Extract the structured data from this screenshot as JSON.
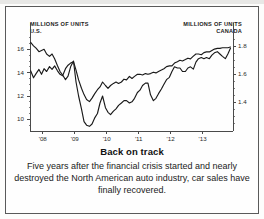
{
  "figure": {
    "caption_title": "Back on track",
    "caption_body": "Five years after the financial crisis started and nearly destroyed the North American auto industry, car sales have finally recovered."
  },
  "chart_data": {
    "type": "line",
    "title": "Back on track",
    "xlabel": "",
    "ylabel": "MILLIONS OF UNITS",
    "grid": false,
    "legend": "none",
    "x_tick_labels": [
      "'08",
      "'09",
      "'10",
      "'11",
      "'12",
      "'13"
    ],
    "x_tick_values": [
      2008,
      2009,
      2010,
      2011,
      2012,
      2013
    ],
    "xlim": [
      2007.6,
      2013.95
    ],
    "left_axis": {
      "label": "MILLIONS OF UNITS",
      "sublabel": "U.S.",
      "ticks": [
        16,
        14,
        12,
        10
      ],
      "tick_labels": [
        "16",
        "14",
        "12",
        "10"
      ],
      "ylim": [
        9.0,
        17.4
      ]
    },
    "right_axis": {
      "label": "MILLIONS OF UNITS",
      "sublabel": "CANADA",
      "ticks": [
        1.8,
        1.6,
        1.4
      ],
      "tick_labels": [
        "1.8",
        "1.6",
        "1.4"
      ],
      "ylim": [
        1.195,
        1.895
      ]
    },
    "series": [
      {
        "name": "U.S. light vehicle sales",
        "axis": "left",
        "units": "millions of units, SAAR",
        "color": "#1a1a1a",
        "x": [
          2007.62,
          2007.71,
          2007.79,
          2007.88,
          2007.96,
          2008.04,
          2008.12,
          2008.21,
          2008.29,
          2008.37,
          2008.46,
          2008.54,
          2008.62,
          2008.71,
          2008.79,
          2008.87,
          2008.96,
          2009.04,
          2009.12,
          2009.21,
          2009.29,
          2009.37,
          2009.46,
          2009.54,
          2009.62,
          2009.71,
          2009.79,
          2009.87,
          2009.96,
          2010.04,
          2010.12,
          2010.21,
          2010.29,
          2010.37,
          2010.46,
          2010.54,
          2010.62,
          2010.71,
          2010.79,
          2010.87,
          2010.96,
          2011.04,
          2011.12,
          2011.21,
          2011.29,
          2011.37,
          2011.46,
          2011.54,
          2011.62,
          2011.71,
          2011.79,
          2011.87,
          2011.96,
          2012.04,
          2012.12,
          2012.21,
          2012.29,
          2012.37,
          2012.46,
          2012.54,
          2012.62,
          2012.71,
          2012.79,
          2012.87,
          2012.96,
          2013.04,
          2013.12,
          2013.21,
          2013.29,
          2013.37,
          2013.46,
          2013.54,
          2013.62,
          2013.71,
          2013.79,
          2013.87
        ],
        "y": [
          16.6,
          16.3,
          16.1,
          15.8,
          15.9,
          16.0,
          15.6,
          15.4,
          15.6,
          15.2,
          14.6,
          14.1,
          13.8,
          13.4,
          13.7,
          14.5,
          15.0,
          13.2,
          12.0,
          10.9,
          9.8,
          9.5,
          9.4,
          9.6,
          10.1,
          10.5,
          11.4,
          12.0,
          11.0,
          10.6,
          10.4,
          10.7,
          10.9,
          11.2,
          11.4,
          11.6,
          11.6,
          11.4,
          11.5,
          11.8,
          12.3,
          12.5,
          12.9,
          13.1,
          13.1,
          12.1,
          11.6,
          11.8,
          12.2,
          12.6,
          13.0,
          13.4,
          13.6,
          14.1,
          14.5,
          14.4,
          14.4,
          14.1,
          14.1,
          14.4,
          14.5,
          14.3,
          14.9,
          15.2,
          15.3,
          15.2,
          15.3,
          15.2,
          15.5,
          15.7,
          15.8,
          15.6,
          15.4,
          15.2,
          15.6,
          16.1
        ]
      },
      {
        "name": "Canada light vehicle sales",
        "axis": "right",
        "units": "millions of units, SAAR",
        "color": "#1a1a1a",
        "x": [
          2007.62,
          2007.71,
          2007.79,
          2007.88,
          2007.96,
          2008.04,
          2008.12,
          2008.21,
          2008.29,
          2008.37,
          2008.46,
          2008.54,
          2008.62,
          2008.71,
          2008.79,
          2008.87,
          2008.96,
          2009.04,
          2009.12,
          2009.21,
          2009.29,
          2009.37,
          2009.46,
          2009.54,
          2009.62,
          2009.71,
          2009.79,
          2009.87,
          2009.96,
          2010.04,
          2010.12,
          2010.21,
          2010.29,
          2010.37,
          2010.46,
          2010.54,
          2010.62,
          2010.71,
          2010.79,
          2010.87,
          2010.96,
          2011.04,
          2011.12,
          2011.21,
          2011.29,
          2011.37,
          2011.46,
          2011.54,
          2011.62,
          2011.71,
          2011.79,
          2011.87,
          2011.96,
          2012.04,
          2012.12,
          2012.21,
          2012.29,
          2012.37,
          2012.46,
          2012.54,
          2012.62,
          2012.71,
          2012.79,
          2012.87,
          2012.96,
          2013.04,
          2013.12,
          2013.21,
          2013.29,
          2013.37,
          2013.46,
          2013.54,
          2013.62,
          2013.71,
          2013.79,
          2013.87
        ],
        "y": [
          1.625,
          1.575,
          1.605,
          1.635,
          1.6,
          1.64,
          1.62,
          1.655,
          1.635,
          1.66,
          1.625,
          1.6,
          1.59,
          1.64,
          1.665,
          1.68,
          1.69,
          1.63,
          1.56,
          1.5,
          1.455,
          1.42,
          1.405,
          1.43,
          1.46,
          1.49,
          1.51,
          1.545,
          1.52,
          1.5,
          1.52,
          1.535,
          1.545,
          1.535,
          1.545,
          1.565,
          1.56,
          1.585,
          1.57,
          1.585,
          1.6,
          1.6,
          1.595,
          1.605,
          1.6,
          1.605,
          1.615,
          1.61,
          1.62,
          1.63,
          1.64,
          1.655,
          1.66,
          1.66,
          1.68,
          1.69,
          1.7,
          1.695,
          1.705,
          1.715,
          1.71,
          1.73,
          1.745,
          1.745,
          1.74,
          1.755,
          1.76,
          1.76,
          1.77,
          1.78,
          1.785,
          1.785,
          1.79,
          1.79,
          1.79,
          1.795
        ]
      }
    ]
  }
}
